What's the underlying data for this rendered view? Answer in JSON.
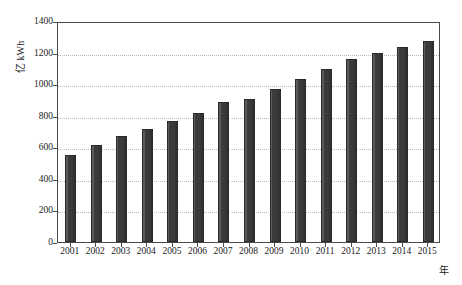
{
  "chart_data": {
    "type": "bar",
    "title": "",
    "subtitle": "",
    "xlabel": "年",
    "ylabel": "亿 kWh",
    "categories": [
      "2001",
      "2002",
      "2003",
      "2004",
      "2005",
      "2006",
      "2007",
      "2008",
      "2009",
      "2010",
      "2011",
      "2012",
      "2013",
      "2014",
      "2015"
    ],
    "values": [
      550,
      615,
      670,
      715,
      765,
      815,
      885,
      905,
      970,
      1035,
      1095,
      1160,
      1200,
      1235,
      1275
    ],
    "ylim": [
      0,
      1400
    ],
    "y_ticks": [
      "0",
      "200",
      "400",
      "600",
      "800",
      "1000",
      "1200",
      "1400"
    ],
    "y_tick_values": [
      0,
      200,
      400,
      600,
      800,
      1000,
      1200,
      1400
    ],
    "grid": "horizontal-dotted",
    "legend": "none",
    "bar_color": "#3a3a3a",
    "grid_color": "#b9b9b9",
    "axis_color": "#4a4a4a",
    "background": "#ffffff"
  }
}
